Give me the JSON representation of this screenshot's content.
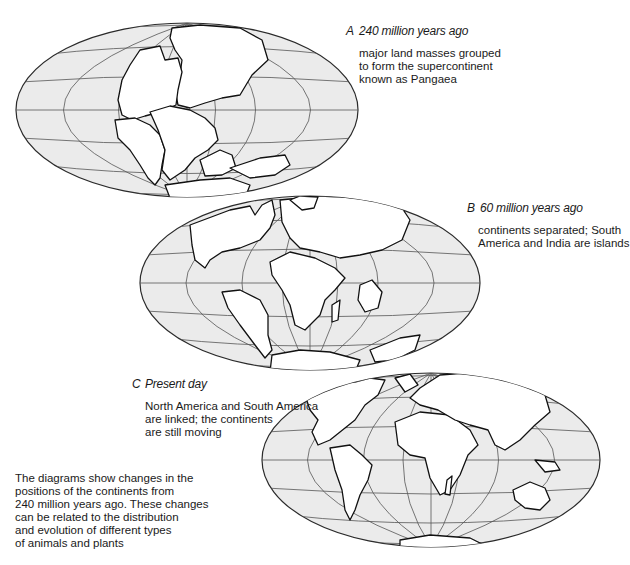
{
  "figure": {
    "panels": [
      {
        "id": "A",
        "letter": "A",
        "title": "240 million years ago",
        "description_lines": [
          "major land masses grouped",
          "to form the supercontinent",
          "known as Pangaea"
        ],
        "globe": {
          "cx": 187,
          "cy": 110,
          "rx": 171,
          "ry": 87
        }
      },
      {
        "id": "B",
        "letter": "B",
        "title": "60 million years ago",
        "description_lines": [
          "continents separated; South",
          "America and India are islands"
        ],
        "globe": {
          "cx": 310,
          "cy": 283,
          "rx": 170,
          "ry": 87
        }
      },
      {
        "id": "C",
        "letter": "C",
        "title": "Present day",
        "description_lines": [
          "North America and South America",
          "are linked; the continents",
          "are still moving"
        ],
        "globe": {
          "cx": 431,
          "cy": 460,
          "rx": 169,
          "ry": 87
        }
      }
    ],
    "summary_lines": [
      "The diagrams show changes in the",
      "positions of the continents from",
      "240 million years ago. These changes",
      "can be related to the distribution",
      "and evolution of different types",
      "of animals and plants"
    ],
    "colors": {
      "ocean": "#ebebeb",
      "land": "#ffffff",
      "grid": "#555555",
      "outline": "#111111"
    }
  }
}
